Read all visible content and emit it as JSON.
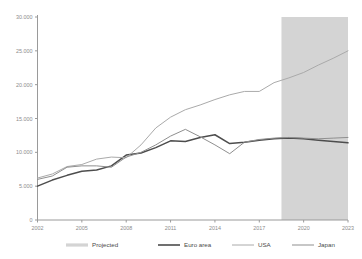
{
  "chart_data": {
    "type": "line",
    "title": "",
    "subtitle": "",
    "xlabel": "",
    "ylabel": "",
    "xlim": [
      2002,
      2023
    ],
    "ylim": [
      0,
      30000
    ],
    "grid": false,
    "legend_position": "bottom",
    "y_ticks": [
      "0",
      "5.000",
      "10.000",
      "15.000",
      "20.000",
      "25.000",
      "30.000"
    ],
    "y_tick_values": [
      0,
      5000,
      10000,
      15000,
      20000,
      25000,
      30000
    ],
    "x_ticks": [
      "2002",
      "2005",
      "2008",
      "2011",
      "2014",
      "2017",
      "2020",
      "2023"
    ],
    "x_tick_values": [
      2002,
      2005,
      2008,
      2011,
      2014,
      2017,
      2020,
      2023
    ],
    "x": [
      2002,
      2003,
      2004,
      2005,
      2006,
      2007,
      2008,
      2009,
      2010,
      2011,
      2012,
      2013,
      2014,
      2015,
      2016,
      2017,
      2018,
      2019,
      2020,
      2021,
      2022,
      2023
    ],
    "projected_band": {
      "label": "Projected",
      "start": 2018.5,
      "end": 2023,
      "color": "#d4d4d4"
    },
    "series": [
      {
        "name": "Euro area",
        "color": "#4d4d4d",
        "width": 1.5,
        "values": [
          5000,
          5900,
          6600,
          7200,
          7400,
          8000,
          9600,
          9900,
          10700,
          11700,
          11600,
          12200,
          12600,
          11300,
          11500,
          11800,
          12000,
          12100,
          12000,
          11800,
          11600,
          11400
        ]
      },
      {
        "name": "USA",
        "color": "#aaaaaa",
        "width": 1.0,
        "values": [
          6200,
          6800,
          7900,
          8200,
          9000,
          9300,
          9200,
          11100,
          13600,
          15200,
          16300,
          17000,
          17800,
          18500,
          19000,
          19000,
          20300,
          21000,
          21800,
          22900,
          23900,
          25000
        ]
      },
      {
        "name": "Japan",
        "color": "#8f8f8f",
        "width": 1.0,
        "values": [
          6000,
          6500,
          7800,
          8000,
          8000,
          7800,
          9300,
          10000,
          11100,
          12400,
          13400,
          12300,
          11100,
          9800,
          11500,
          11900,
          12100,
          12200,
          12100,
          12000,
          12100,
          12200
        ]
      }
    ]
  },
  "legend": {
    "items": [
      {
        "label": "Projected",
        "icon": "thick-gray-line-swatch"
      },
      {
        "label": "Euro area",
        "icon": "dark-line-swatch"
      },
      {
        "label": "USA",
        "icon": "light-line-swatch"
      },
      {
        "label": "Japan",
        "icon": "mid-line-swatch"
      }
    ]
  },
  "colors": {
    "projected_band": "#d4d4d4",
    "euro_area": "#4d4d4d",
    "usa": "#aaaaaa",
    "japan": "#8f8f8f",
    "axis": "#9a9a9a",
    "tick_text": "#8c8c8c",
    "legend_text": "#4a4a4a",
    "background": "#ffffff"
  }
}
